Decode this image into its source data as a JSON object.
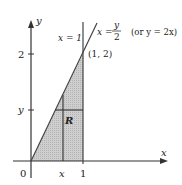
{
  "diagram": {
    "type": "region-of-integration",
    "axes": {
      "x_label": "x",
      "y_label": "y",
      "origin_label": "0"
    },
    "ticks": {
      "x": [
        {
          "label": "x",
          "value": "x"
        },
        {
          "label": "1",
          "value": 1
        }
      ],
      "y": [
        {
          "label": "y",
          "value": "y"
        },
        {
          "label": "2",
          "value": 2
        }
      ]
    },
    "curves": [
      {
        "label": "x = 1",
        "kind": "vertical-line"
      },
      {
        "label_lhs": "x =",
        "label_num": "y",
        "label_den": "2",
        "note": "(or y = 2x)",
        "kind": "diagonal-line"
      }
    ],
    "points": [
      {
        "label": "(1, 2)",
        "x": 1,
        "y": 2
      }
    ],
    "region": {
      "label": "R",
      "fill_color": "#bdbdbd"
    },
    "colors": {
      "line": "#333333",
      "shade": "#c4c4c4"
    }
  }
}
